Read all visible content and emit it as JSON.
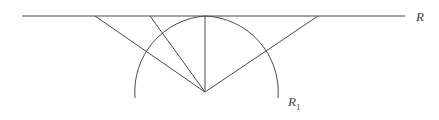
{
  "diagram": {
    "type": "geometric-construction",
    "labels": {
      "line": "R",
      "arc_main": "R",
      "arc_sub": "1"
    },
    "colors": {
      "stroke": "#4a4a4a",
      "text": "#444444",
      "background": "#ffffff"
    },
    "elements": {
      "line_R": {
        "x1": 22,
        "y1": 16,
        "x2": 405,
        "y2": 16
      },
      "apex": {
        "x": 205,
        "y": 92
      },
      "arc_R1": {
        "cx": 205,
        "cy": 92,
        "r": 76,
        "start": {
          "x": 135,
          "y": 98
        },
        "end": {
          "x": 278,
          "y": 98
        }
      },
      "rays": [
        {
          "x1": 205,
          "y1": 92,
          "x2": 95,
          "y2": 16
        },
        {
          "x1": 205,
          "y1": 92,
          "x2": 150,
          "y2": 16
        },
        {
          "x1": 205,
          "y1": 92,
          "x2": 205,
          "y2": 16
        },
        {
          "x1": 205,
          "y1": 92,
          "x2": 318,
          "y2": 16
        }
      ]
    }
  }
}
